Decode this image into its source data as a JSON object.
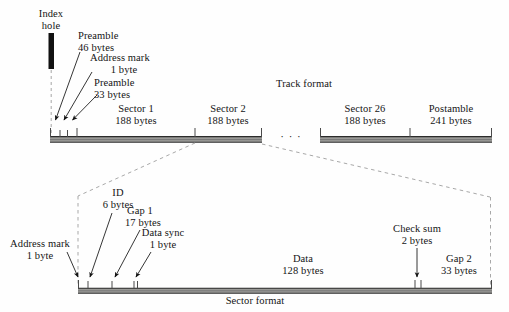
{
  "figure": {
    "title_track": "Track format",
    "title_sector": "Sector format",
    "ellipsis": "· · ·"
  },
  "track": {
    "index_hole": {
      "line1": "Index",
      "line2": "hole"
    },
    "callouts": [
      {
        "name": "preamble-46",
        "line1": "Preamble",
        "line2": "46 bytes"
      },
      {
        "name": "address-mark-1",
        "line1": "Address mark",
        "line2": "1 byte"
      },
      {
        "name": "preamble-33",
        "line1": "Preamble",
        "line2": "33 bytes"
      }
    ],
    "fields": [
      {
        "name": "sector-1",
        "line1": "Sector 1",
        "line2": "188 bytes"
      },
      {
        "name": "sector-2",
        "line1": "Sector 2",
        "line2": "188 bytes"
      },
      {
        "name": "sector-26",
        "line1": "Sector 26",
        "line2": "188 bytes"
      },
      {
        "name": "postamble",
        "line1": "Postamble",
        "line2": "241 bytes"
      }
    ]
  },
  "sector": {
    "callouts": [
      {
        "name": "address-mark",
        "line1": "Address mark",
        "line2": "1 byte"
      },
      {
        "name": "id",
        "line1": "ID",
        "line2": "6 bytes"
      },
      {
        "name": "gap-1",
        "line1": "Gap 1",
        "line2": "17 bytes"
      },
      {
        "name": "data-sync",
        "line1": "Data sync",
        "line2": "1 byte"
      },
      {
        "name": "check-sum",
        "line1": "Check sum",
        "line2": "2 bytes"
      }
    ],
    "fields": [
      {
        "name": "data",
        "line1": "Data",
        "line2": "128 bytes"
      },
      {
        "name": "gap-2",
        "line1": "Gap 2",
        "line2": "33 bytes"
      }
    ]
  },
  "colors": {
    "ink": "#141414",
    "bar_fill": "#9a9a97",
    "bar_rule": "#2a2a2a",
    "dashed": "#9b9b9b"
  }
}
